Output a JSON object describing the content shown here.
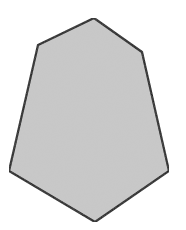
{
  "figure": {
    "shape": "hexagon",
    "vertices": [
      [
        94,
        18
      ],
      [
        142,
        52
      ],
      [
        169,
        171
      ],
      [
        95,
        222
      ],
      [
        9,
        171
      ],
      [
        38,
        45
      ]
    ],
    "fill_color": "#c9c9c9",
    "stroke_color": "#111111",
    "stroke_width": 2.2
  }
}
